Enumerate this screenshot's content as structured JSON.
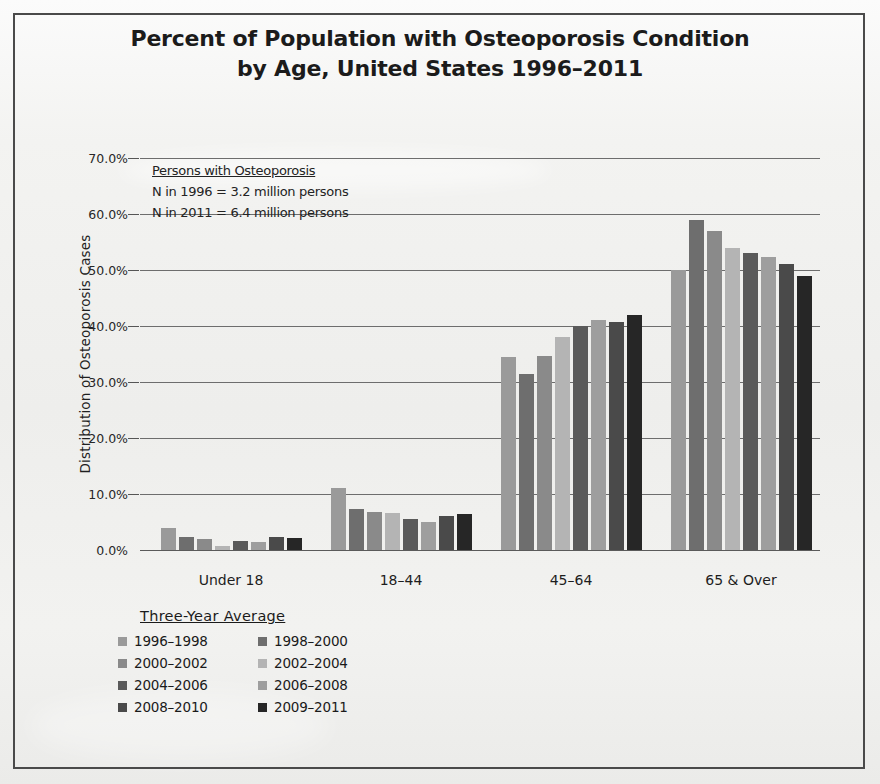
{
  "title": {
    "line1": "Percent of Population with Osteoporosis Condition",
    "line2": "by Age, United States 1996–2011"
  },
  "annotation": {
    "heading": "Persons with Osteoporosis",
    "line1": "N  in 1996 = 3.2 million persons",
    "line2": "N  in 2011 = 6.4 million persons"
  },
  "legend": {
    "title": "Three-Year Average"
  },
  "axis": {
    "ylabel": "Distribution of Osteoporosis Cases",
    "yticks": [
      "70.0%",
      "60.0%",
      "50.0%",
      "40.0%",
      "30.0%",
      "20.0%",
      "10.0%",
      "0.0%"
    ]
  },
  "chart_data": {
    "type": "bar",
    "title": "Percent of Population with Osteoporosis Condition by Age, United States 1996–2011",
    "xlabel": "",
    "ylabel": "Distribution of Osteoporosis Cases",
    "ylim": [
      0,
      70
    ],
    "ytick_values": [
      0,
      10,
      20,
      30,
      40,
      50,
      60,
      70
    ],
    "ytick_labels": [
      "0.0%",
      "10.0%",
      "20.0%",
      "30.0%",
      "40.0%",
      "50.0%",
      "60.0%",
      "70.0%"
    ],
    "grid": true,
    "legend_position": "below-left",
    "legend_title": "Three-Year Average",
    "categories": [
      "Under 18",
      "18–44",
      "45–64",
      "65 & Over"
    ],
    "series": [
      {
        "name": "1996–1998",
        "color": "#9a9a9a",
        "values": [
          4.0,
          11.0,
          34.5,
          50.0
        ]
      },
      {
        "name": "1998–2000",
        "color": "#6e6e6e",
        "values": [
          2.3,
          7.3,
          31.5,
          59.0
        ]
      },
      {
        "name": "2000–2002",
        "color": "#8a8a8a",
        "values": [
          1.9,
          6.7,
          34.7,
          57.0
        ]
      },
      {
        "name": "2002–2004",
        "color": "#b4b4b4",
        "values": [
          0.8,
          6.6,
          38.0,
          54.0
        ]
      },
      {
        "name": "2004–2006",
        "color": "#5a5a5a",
        "values": [
          1.6,
          5.6,
          40.0,
          53.0
        ]
      },
      {
        "name": "2006–2008",
        "color": "#9e9e9e",
        "values": [
          1.4,
          5.0,
          41.0,
          52.3
        ]
      },
      {
        "name": "2008–2010",
        "color": "#4a4a4a",
        "values": [
          2.4,
          6.0,
          40.7,
          51.0
        ]
      },
      {
        "name": "2009–2011",
        "color": "#262626",
        "values": [
          2.2,
          6.4,
          42.0,
          49.0
        ]
      }
    ],
    "annotations": [
      "Persons with Osteoporosis",
      "N  in 1996 = 3.2 million persons",
      "N  in 2011 = 6.4 million persons"
    ]
  }
}
